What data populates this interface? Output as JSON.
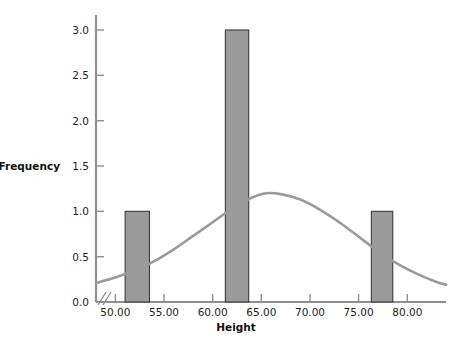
{
  "chart_data": {
    "type": "bar",
    "title": "",
    "subtitle": "",
    "xlabel": "Height",
    "ylabel": "Frequency",
    "xlim": [
      48.0,
      84.0
    ],
    "ylim": [
      0.0,
      3.15
    ],
    "grid": false,
    "legend": null,
    "x_tick_labels": [
      "50.00",
      "55.00",
      "60.00",
      "65.00",
      "70.00",
      "75.00",
      "80.00"
    ],
    "x_tick_values": [
      50,
      55,
      60,
      65,
      70,
      75,
      80
    ],
    "y_tick_labels": [
      "0.0",
      "0.5",
      "1.0",
      "1.5",
      "2.0",
      "2.5",
      "3.0"
    ],
    "y_tick_values": [
      0.0,
      0.5,
      1.0,
      1.5,
      2.0,
      2.5,
      3.0
    ],
    "axis_break": true,
    "bars": [
      {
        "x_start": 51.0,
        "x_end": 53.5,
        "height": 1.0,
        "label": "1.0"
      },
      {
        "x_start": 61.3,
        "x_end": 63.7,
        "height": 3.0,
        "label": "3.0"
      },
      {
        "x_start": 76.3,
        "x_end": 78.5,
        "height": 1.0,
        "label": "1.0"
      }
    ],
    "categories": [
      "51.0-53.5",
      "61.3-63.7",
      "76.3-78.5"
    ],
    "values": [
      1.0,
      3.0,
      1.0
    ],
    "overlay_curve": {
      "name": "Normal",
      "type": "line",
      "mean": 65.5,
      "peak_value": 1.2,
      "x": [
        48,
        50,
        52,
        54,
        56,
        58,
        60,
        62,
        64,
        65.5,
        67,
        69,
        71,
        73,
        75,
        77,
        79,
        81,
        83,
        84
      ],
      "y": [
        0.21,
        0.27,
        0.35,
        0.45,
        0.58,
        0.73,
        0.88,
        1.03,
        1.15,
        1.2,
        1.19,
        1.13,
        1.02,
        0.88,
        0.72,
        0.56,
        0.42,
        0.31,
        0.22,
        0.19
      ]
    },
    "colors": {
      "bar_fill": "#9b9b9b",
      "bar_edge": "#3a3a3a",
      "curve": "#9a9a9a",
      "axis": "#8f8f8f",
      "text": "#1d1d1d",
      "background": "#ffffff"
    }
  }
}
